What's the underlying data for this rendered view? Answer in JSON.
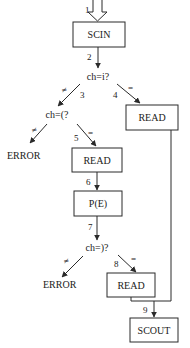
{
  "diagram": {
    "type": "flowchart",
    "nodes": {
      "scin": {
        "label": "SCIN"
      },
      "cond_i": {
        "label": "ch=i?"
      },
      "cond_open": {
        "label": "ch=(?"
      },
      "error1": {
        "label": "ERROR"
      },
      "read_right": {
        "label": "READ"
      },
      "read_mid": {
        "label": "READ"
      },
      "pe": {
        "label": "P(E)"
      },
      "cond_close": {
        "label": "ch=)?"
      },
      "error2": {
        "label": "ERROR"
      },
      "read_low": {
        "label": "READ"
      },
      "scout": {
        "label": "SCOUT"
      }
    },
    "edges": {
      "e1": {
        "num": "1"
      },
      "e2": {
        "num": "2"
      },
      "e3": {
        "num": "3",
        "cond": "≠"
      },
      "e4": {
        "num": "4",
        "cond": "="
      },
      "e_open_ne": {
        "cond": "≠"
      },
      "e5": {
        "num": "5",
        "cond": "="
      },
      "e6": {
        "num": "6"
      },
      "e7": {
        "num": "7"
      },
      "e_close_ne": {
        "cond": "≠"
      },
      "e8": {
        "num": "8",
        "cond": "="
      },
      "e9": {
        "num": "9"
      }
    },
    "colors": {
      "stroke": "#2a2a2a",
      "text": "#1a1a1a",
      "background": "#ffffff"
    }
  }
}
